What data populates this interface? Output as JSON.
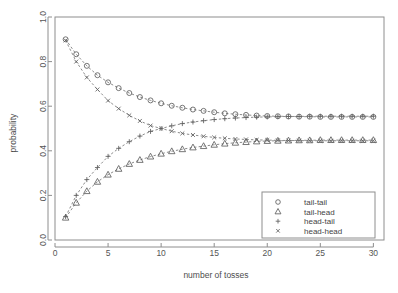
{
  "chart_data": {
    "type": "line",
    "title": "",
    "xlabel": "number of tosses",
    "ylabel": "probability",
    "xlim": [
      0,
      31
    ],
    "ylim": [
      0,
      1.0
    ],
    "grid": false,
    "legend_position": "bottom-right",
    "x_ticks": [
      "0",
      "5",
      "10",
      "15",
      "20",
      "25",
      "30"
    ],
    "x_tick_values": [
      0,
      5,
      10,
      15,
      20,
      25,
      30
    ],
    "y_ticks": [
      "0.0",
      "0.2",
      "0.4",
      "0.6",
      "0.8",
      "1.0"
    ],
    "y_tick_values": [
      0.0,
      0.2,
      0.4,
      0.6,
      0.8,
      1.0
    ],
    "x": [
      1,
      2,
      3,
      4,
      5,
      6,
      7,
      8,
      9,
      10,
      11,
      12,
      13,
      14,
      15,
      16,
      17,
      18,
      19,
      20,
      21,
      22,
      23,
      24,
      25,
      26,
      27,
      28,
      29,
      30
    ],
    "series": [
      {
        "name": "tail-tail",
        "marker": "circle",
        "values": [
          0.9,
          0.833,
          0.781,
          0.739,
          0.707,
          0.681,
          0.659,
          0.641,
          0.626,
          0.613,
          0.602,
          0.593,
          0.585,
          0.579,
          0.573,
          0.568,
          0.564,
          0.561,
          0.558,
          0.556,
          0.555,
          0.554,
          0.553,
          0.553,
          0.552,
          0.552,
          0.552,
          0.552,
          0.552,
          0.552
        ]
      },
      {
        "name": "tail-head",
        "marker": "triangle",
        "values": [
          0.1,
          0.167,
          0.219,
          0.261,
          0.293,
          0.319,
          0.341,
          0.359,
          0.374,
          0.387,
          0.398,
          0.407,
          0.415,
          0.421,
          0.427,
          0.432,
          0.436,
          0.439,
          0.442,
          0.444,
          0.445,
          0.446,
          0.447,
          0.447,
          0.448,
          0.448,
          0.448,
          0.448,
          0.448,
          0.448
        ]
      },
      {
        "name": "head-tail",
        "marker": "plus",
        "values": [
          0.105,
          0.2,
          0.271,
          0.325,
          0.375,
          0.411,
          0.441,
          0.466,
          0.487,
          0.5,
          0.512,
          0.522,
          0.529,
          0.535,
          0.54,
          0.544,
          0.547,
          0.549,
          0.551,
          0.552,
          0.553,
          0.554,
          0.554,
          0.555,
          0.555,
          0.555,
          0.555,
          0.555,
          0.555,
          0.555
        ]
      },
      {
        "name": "head-head",
        "marker": "cross",
        "values": [
          0.895,
          0.8,
          0.729,
          0.675,
          0.625,
          0.589,
          0.559,
          0.534,
          0.513,
          0.5,
          0.488,
          0.478,
          0.471,
          0.465,
          0.46,
          0.456,
          0.453,
          0.451,
          0.449,
          0.448,
          0.447,
          0.446,
          0.446,
          0.445,
          0.445,
          0.445,
          0.445,
          0.445,
          0.445,
          0.445
        ]
      }
    ],
    "legend_entries": [
      {
        "label": "tail-tail",
        "marker": "circle"
      },
      {
        "label": "tail-head",
        "marker": "triangle"
      },
      {
        "label": "head-tail",
        "marker": "plus"
      },
      {
        "label": "head-head",
        "marker": "cross"
      }
    ]
  },
  "colors": {
    "background": "#ffffff",
    "line": "#6d6d6d",
    "marker": "#5f5f5f",
    "frame": "#8e8e8e",
    "text": "#4a4a4a"
  }
}
